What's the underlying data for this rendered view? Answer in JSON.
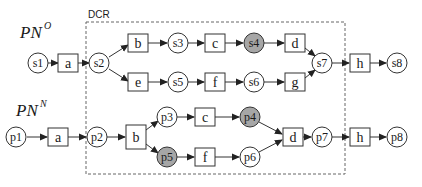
{
  "diagram": {
    "dcr_label": "DCR",
    "colors": {
      "stroke": "#333333",
      "place_fill": "#ffffff",
      "highlight_fill": "#a6a6a6",
      "dashed_box": "#666666"
    },
    "nets": [
      {
        "id": "PNO",
        "title": "PN",
        "superscript": "O",
        "places": [
          {
            "id": "s1",
            "label": "s1",
            "highlighted": false
          },
          {
            "id": "s2",
            "label": "s2",
            "highlighted": false
          },
          {
            "id": "s3",
            "label": "s3",
            "highlighted": false
          },
          {
            "id": "s4",
            "label": "s4",
            "highlighted": true
          },
          {
            "id": "s5",
            "label": "s5",
            "highlighted": false
          },
          {
            "id": "s6",
            "label": "s6",
            "highlighted": false
          },
          {
            "id": "s7",
            "label": "s7",
            "highlighted": false
          },
          {
            "id": "s8",
            "label": "s8",
            "highlighted": false
          }
        ],
        "transitions": [
          {
            "id": "a",
            "label": "a"
          },
          {
            "id": "b",
            "label": "b"
          },
          {
            "id": "c",
            "label": "c"
          },
          {
            "id": "d",
            "label": "d"
          },
          {
            "id": "e",
            "label": "e"
          },
          {
            "id": "f",
            "label": "f"
          },
          {
            "id": "g",
            "label": "g"
          },
          {
            "id": "h",
            "label": "h"
          }
        ],
        "arcs": [
          [
            "s1",
            "a"
          ],
          [
            "a",
            "s2"
          ],
          [
            "s2",
            "b"
          ],
          [
            "s2",
            "e"
          ],
          [
            "b",
            "s3"
          ],
          [
            "s3",
            "c"
          ],
          [
            "c",
            "s4"
          ],
          [
            "s4",
            "d"
          ],
          [
            "e",
            "s5"
          ],
          [
            "s5",
            "f"
          ],
          [
            "f",
            "s6"
          ],
          [
            "s6",
            "g"
          ],
          [
            "d",
            "s7"
          ],
          [
            "g",
            "s7"
          ],
          [
            "s7",
            "h"
          ],
          [
            "h",
            "s8"
          ]
        ]
      },
      {
        "id": "PNN",
        "title": "PN",
        "superscript": "N",
        "places": [
          {
            "id": "p1",
            "label": "p1",
            "highlighted": false
          },
          {
            "id": "p2",
            "label": "p2",
            "highlighted": false
          },
          {
            "id": "p3",
            "label": "p3",
            "highlighted": false
          },
          {
            "id": "p4",
            "label": "p4",
            "highlighted": true
          },
          {
            "id": "p5",
            "label": "p5",
            "highlighted": true
          },
          {
            "id": "p6",
            "label": "p6",
            "highlighted": false
          },
          {
            "id": "p7",
            "label": "p7",
            "highlighted": false
          },
          {
            "id": "p8",
            "label": "p8",
            "highlighted": false
          }
        ],
        "transitions": [
          {
            "id": "a",
            "label": "a"
          },
          {
            "id": "b",
            "label": "b"
          },
          {
            "id": "c",
            "label": "c"
          },
          {
            "id": "f",
            "label": "f"
          },
          {
            "id": "d",
            "label": "d"
          },
          {
            "id": "h",
            "label": "h"
          }
        ],
        "arcs": [
          [
            "p1",
            "a"
          ],
          [
            "a",
            "p2"
          ],
          [
            "p2",
            "b"
          ],
          [
            "b",
            "p3"
          ],
          [
            "b",
            "p5"
          ],
          [
            "p3",
            "c"
          ],
          [
            "c",
            "p4"
          ],
          [
            "p5",
            "f"
          ],
          [
            "f",
            "p6"
          ],
          [
            "p4",
            "d"
          ],
          [
            "p6",
            "d"
          ],
          [
            "d",
            "p7"
          ],
          [
            "p7",
            "h"
          ],
          [
            "h",
            "p8"
          ]
        ]
      }
    ]
  }
}
